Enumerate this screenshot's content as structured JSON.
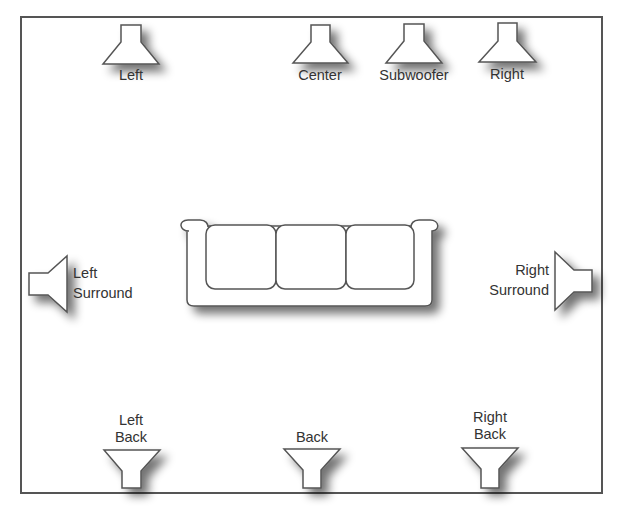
{
  "diagram": {
    "colors": {
      "stroke": "#555555",
      "fill": "#ffffff",
      "shadow": "#9a9a9a",
      "text": "#333333"
    },
    "speakers": {
      "left": {
        "label": "Left"
      },
      "center": {
        "label": "Center"
      },
      "subwoofer": {
        "label": "Subwoofer"
      },
      "right": {
        "label": "Right"
      },
      "left_surround": {
        "label_line1": "Left",
        "label_line2": "Surround"
      },
      "right_surround": {
        "label_line1": "Right",
        "label_line2": "Surround"
      },
      "left_back": {
        "label_line1": "Left",
        "label_line2": "Back"
      },
      "back": {
        "label": "Back"
      },
      "right_back": {
        "label_line1": "Right",
        "label_line2": "Back"
      }
    },
    "couch": {
      "cushions": 3
    }
  }
}
